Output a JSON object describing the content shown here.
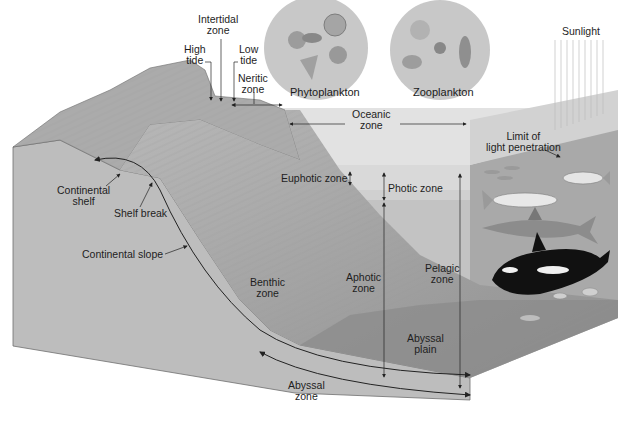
{
  "diagram": {
    "colors": {
      "background": "#ffffff",
      "land_top": "#a8a8a8",
      "land_side": "#bdbdbd",
      "water_light": "#d9d9d9",
      "water_mid": "#c4c4c4",
      "water_deep": "#b2b2b2",
      "seafloor": "#8e8e8e",
      "plankton_circle": "#c9c9c9",
      "label_text": "#1e1e1e",
      "arrow": "#222222"
    },
    "plankton": {
      "phyto": "Phytoplankton",
      "zoo": "Zooplankton"
    },
    "labels": {
      "intertidal": [
        "Intertidal",
        "zone"
      ],
      "high_tide": [
        "High",
        "tide"
      ],
      "low_tide": [
        "Low",
        "tide"
      ],
      "neritic": [
        "Neritic",
        "zone"
      ],
      "oceanic": [
        "Oceanic",
        "zone"
      ],
      "sunlight": "Sunlight",
      "limit_light": [
        "Limit of",
        "light penetration"
      ],
      "continental_shelf": [
        "Continental",
        "shelf"
      ],
      "shelf_break": "Shelf break",
      "continental_slope": "Continental slope",
      "euphotic": "Euphotic zone",
      "photic": "Photic zone",
      "benthic": [
        "Benthic",
        "zone"
      ],
      "aphotic": [
        "Aphotic",
        "zone"
      ],
      "pelagic": [
        "Pelagic",
        "zone"
      ],
      "abyssal_plain": [
        "Abyssal",
        "plain"
      ],
      "abyssal_zone": [
        "Abyssal",
        "zone"
      ]
    },
    "organisms": [
      "fish-school",
      "tuna",
      "tuna",
      "shark",
      "orca",
      "bottom-fish"
    ]
  }
}
